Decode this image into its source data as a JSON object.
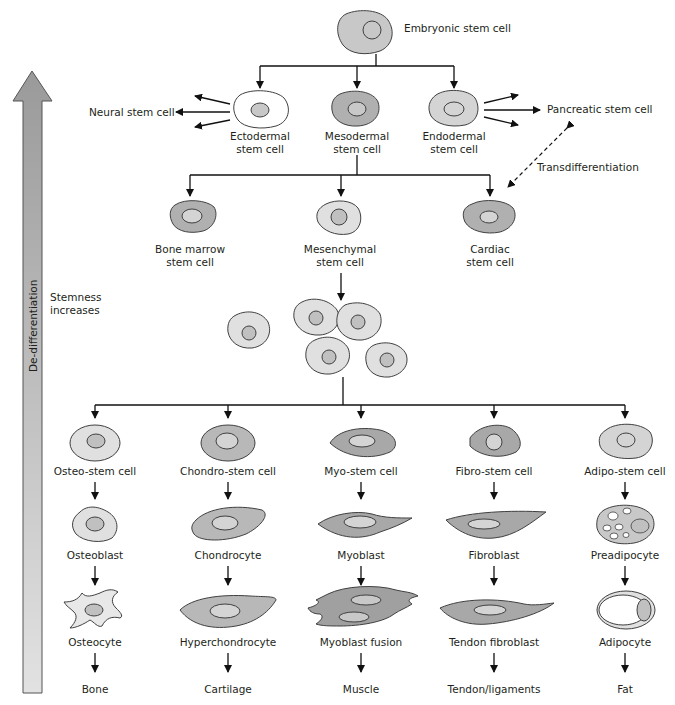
{
  "diagram": {
    "colors": {
      "dark_cell": "#b0b0b0",
      "mid_cell": "#c8c8c8",
      "light_cell": "#e0e0e0",
      "white_cell": "#ffffff",
      "outline": "#404040",
      "arrow": "#111111",
      "side_arrow_top": "#9a9a9a",
      "side_arrow_bottom": "#dcdcdc"
    },
    "side_arrow": {
      "label": "De-differentiation",
      "note_line1": "Stemness",
      "note_line2": "increases"
    },
    "top": {
      "label": "Embryonic stem cell"
    },
    "germ_layers": [
      {
        "line1": "Ectodermal",
        "line2": "stem cell"
      },
      {
        "line1": "Mesodermal",
        "line2": "stem cell"
      },
      {
        "line1": "Endodermal",
        "line2": "stem cell"
      }
    ],
    "neural": "Neural stem cell",
    "pancreatic": "Pancreatic stem cell",
    "transdifferentiation": "Transdifferentiation",
    "mesodermal_derivatives": [
      {
        "line1": "Bone marrow",
        "line2": "stem cell"
      },
      {
        "line1": "Mesenchymal",
        "line2": "stem cell"
      },
      {
        "line1": "Cardiac",
        "line2": "stem cell"
      }
    ],
    "lineages": [
      {
        "stem": "Osteo-stem cell",
        "stage1": "Osteoblast",
        "stage2": "Osteocyte",
        "tissue": "Bone"
      },
      {
        "stem": "Chondro-stem cell",
        "stage1": "Chondrocyte",
        "stage2": "Hyperchondrocyte",
        "tissue": "Cartilage"
      },
      {
        "stem": "Myo-stem cell",
        "stage1": "Myoblast",
        "stage2": "Myoblast fusion",
        "tissue": "Muscle"
      },
      {
        "stem": "Fibro-stem cell",
        "stage1": "Fibroblast",
        "stage2": "Tendon fibroblast",
        "tissue": "Tendon/ligaments"
      },
      {
        "stem": "Adipo-stem cell",
        "stage1": "Preadipocyte",
        "stage2": "Adipocyte",
        "tissue": "Fat"
      }
    ]
  }
}
